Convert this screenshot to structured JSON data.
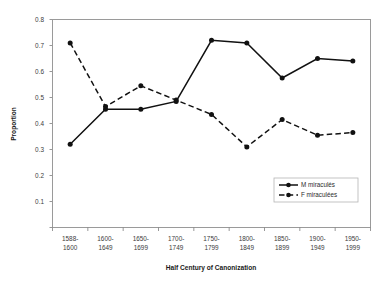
{
  "chart_data": {
    "type": "line",
    "title": "",
    "xlabel": "Half Century of Canonization",
    "ylabel": "Proportion",
    "categories": [
      "1588-\n1600",
      "1600-\n1649",
      "1650-\n1699",
      "1700-\n1749",
      "1750-\n1799",
      "1800-\n1849",
      "1850-\n1899",
      "1900-\n1949",
      "1950-\n1999"
    ],
    "category_lines": [
      [
        "1588-",
        "1600"
      ],
      [
        "1600-",
        "1649"
      ],
      [
        "1650-",
        "1699"
      ],
      [
        "1700-",
        "1749"
      ],
      [
        "1750-",
        "1799"
      ],
      [
        "1800-",
        "1849"
      ],
      [
        "1850-",
        "1899"
      ],
      [
        "1900-",
        "1949"
      ],
      [
        "1950-",
        "1999"
      ]
    ],
    "ylim": [
      0,
      0.8
    ],
    "ytick_values": [
      0,
      0.1,
      0.2,
      0.3,
      0.4,
      0.5,
      0.6,
      0.7,
      0.8
    ],
    "ytick_labels": [
      "",
      "0.1",
      "0.2",
      "0.3",
      "0.4",
      "0.5",
      "0.6",
      "0.7",
      "0.8"
    ],
    "grid": false,
    "legend_position": "inside-bottom-right",
    "series": [
      {
        "name": "M miraculés",
        "style": "solid",
        "marker": "diamond",
        "color": "#111111",
        "values": [
          0.32,
          0.455,
          0.455,
          0.485,
          0.72,
          0.71,
          0.575,
          0.65,
          0.64
        ]
      },
      {
        "name": "F miraculées",
        "style": "dashed",
        "marker": "diamond",
        "color": "#111111",
        "values": [
          0.71,
          0.465,
          0.545,
          0.49,
          0.435,
          0.31,
          0.415,
          0.355,
          0.365
        ]
      }
    ]
  },
  "axes": {
    "ylabel": "Proportion",
    "xlabel": "Half Century of Canonization"
  },
  "legend": {
    "items": [
      {
        "label": "M miraculés"
      },
      {
        "label": "F miraculées"
      }
    ]
  }
}
